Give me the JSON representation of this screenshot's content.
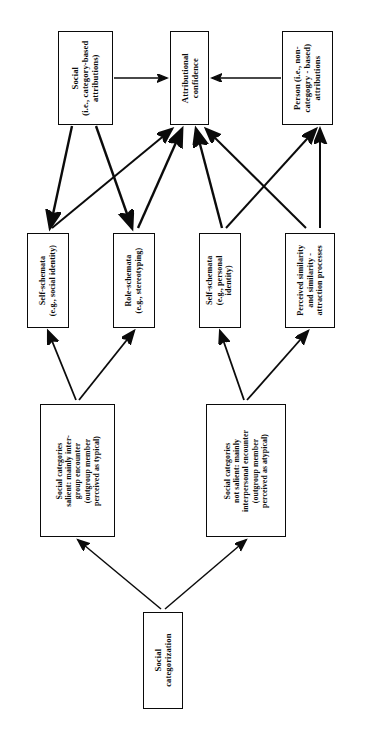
{
  "diagram": {
    "orientation": "rotated-90",
    "line_color": "#0b0b0b",
    "box_fill": "#ffffff",
    "nodes": {
      "social": "Social\n(i.e., category-based\nattributions)",
      "social_lines": [
        "Social",
        "(i.e., category-based",
        "attributions)"
      ],
      "attributional_confidence_lines": [
        "Attributional",
        "confidence"
      ],
      "person_lines": [
        "Person (i.e., non-",
        "categogry - based)",
        "attributions"
      ],
      "self_schemata_social_lines": [
        "Self-schemata",
        "(e.g., social identity)"
      ],
      "role_schemata_lines": [
        "Role-schemata",
        "(e.g., stereotyping)"
      ],
      "self_schemata_personal_lines": [
        "Self-schemata",
        "(e.g., personal",
        "identity)"
      ],
      "perceived_similarity_lines": [
        "Perceived similarity",
        "and similarity -",
        "attraction processes"
      ],
      "categories_salient_lines": [
        "Social categories",
        "salient: mainly inter-",
        "group encounter",
        "(outgroup member",
        "perceived as typical)"
      ],
      "categories_not_salient_lines": [
        "Social categories",
        "not salient: mainly",
        "interpersonal encounter",
        "(outgroup member",
        "perceived as atypical)"
      ],
      "social_categorization_lines": [
        "Social",
        "categorization"
      ]
    },
    "edges": [
      {
        "from": "social",
        "to": "attributional-confidence",
        "style": "arrow-right"
      },
      {
        "from": "person",
        "to": "attributional-confidence",
        "style": "arrow-left"
      },
      {
        "from": "social",
        "to": "self-schemata-social",
        "style": "arrow-down"
      },
      {
        "from": "social",
        "to": "role-schemata",
        "style": "arrow-down"
      },
      {
        "from": "self-schemata-social",
        "to": "attributional-confidence",
        "style": "arrow-up"
      },
      {
        "from": "role-schemata",
        "to": "attributional-confidence",
        "style": "arrow-up"
      },
      {
        "from": "self-schemata-personal",
        "to": "attributional-confidence",
        "style": "arrow-up"
      },
      {
        "from": "perceived-similarity",
        "to": "attributional-confidence",
        "style": "arrow-up"
      },
      {
        "from": "self-schemata-personal",
        "to": "person",
        "style": "arrow-up"
      },
      {
        "from": "perceived-similarity",
        "to": "person",
        "style": "arrow-up"
      },
      {
        "from": "categories-salient",
        "to": "self-schemata-social",
        "style": "arrow-up"
      },
      {
        "from": "categories-salient",
        "to": "role-schemata",
        "style": "arrow-up"
      },
      {
        "from": "categories-not-salient",
        "to": "self-schemata-personal",
        "style": "arrow-up"
      },
      {
        "from": "categories-not-salient",
        "to": "perceived-similarity",
        "style": "arrow-up"
      },
      {
        "from": "social-categorization",
        "to": "categories-salient",
        "style": "arrow-up"
      },
      {
        "from": "social-categorization",
        "to": "categories-not-salient",
        "style": "arrow-up"
      }
    ]
  }
}
